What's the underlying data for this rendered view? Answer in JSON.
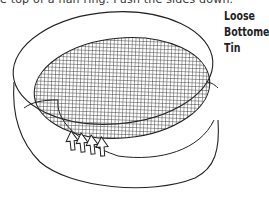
{
  "caption": {
    "text": "e top of a flan ring. Push the sides down."
  },
  "label": {
    "lines": [
      "Loose",
      "Bottomed",
      "Tin"
    ]
  },
  "diagram": {
    "arrows_count": 4,
    "colors": {
      "line": "#222222",
      "hatch": "#333333",
      "background": "#ffffff"
    }
  }
}
